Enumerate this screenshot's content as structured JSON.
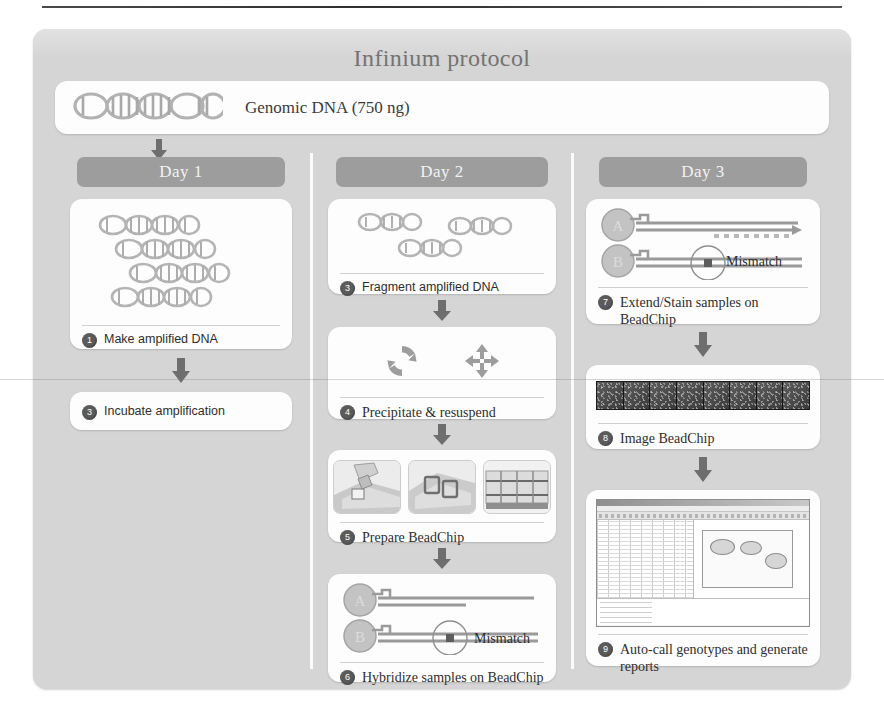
{
  "figure": {
    "title": "Infinium protocol",
    "input": {
      "icon": "dna-helix-icon",
      "label": "Genomic DNA (750 ng)"
    }
  },
  "columns": [
    {
      "header": "Day 1",
      "steps": [
        {
          "number": "1",
          "label": "Make amplified DNA",
          "art": "dna-strands"
        },
        {
          "number": "2",
          "label": "Incubate amplification",
          "art": "none"
        }
      ]
    },
    {
      "header": "Day 2",
      "steps": [
        {
          "number": "3",
          "label": "Fragment amplified DNA",
          "art": "fragmented-dna"
        },
        {
          "number": "4",
          "label": "Precipitate & resuspend",
          "art": "recycle-and-move-icons"
        },
        {
          "number": "5",
          "label": "Prepare BeadChip",
          "art": "beadchip-photos"
        },
        {
          "number": "6",
          "label": "Hybridize samples on BeadChip",
          "art": "probe-mismatch"
        }
      ]
    },
    {
      "header": "Day 3",
      "steps": [
        {
          "number": "7",
          "label": "Extend/Stain samples on BeadChip",
          "art": "probe-extend-mismatch"
        },
        {
          "number": "8",
          "label": "Image BeadChip",
          "art": "beadchip-scan-strip"
        },
        {
          "number": "9",
          "label": "Auto-call genotypes and generate reports",
          "art": "genotyping-software"
        }
      ]
    }
  ],
  "annotations": {
    "mismatch": "Mismatch",
    "bead_a": "A",
    "bead_b": "B"
  },
  "colors": {
    "poster_background": "#d5d5d5",
    "card_background": "#fdfdfd",
    "day_header": "#9d9d9d",
    "badge": "#5b5b5b",
    "title_text": "#737373",
    "body_text": "#2e2e2e",
    "dna_gray": "#b0b0b0",
    "arrow": "#6e6e6e"
  }
}
